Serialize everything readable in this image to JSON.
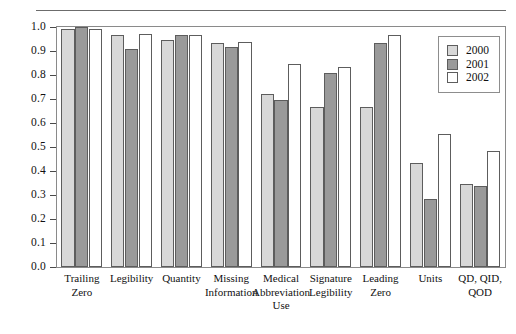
{
  "chart_data": {
    "type": "bar",
    "title": "",
    "xlabel": "",
    "ylabel": "",
    "ylim": [
      0.0,
      1.0
    ],
    "grid": false,
    "legend_position": "top-right",
    "ytick_labels": [
      "1.0",
      "0.9",
      "0.8",
      "0.7",
      "0.6",
      "0.5",
      "0.4",
      "0.3",
      "0.2",
      "0.1",
      "0.0"
    ],
    "ytick_values": [
      1.0,
      0.9,
      0.8,
      0.7,
      0.6,
      0.5,
      0.4,
      0.3,
      0.2,
      0.1,
      0.0
    ],
    "categories": [
      "Trailing Zero",
      "Legibility",
      "Quantity",
      "Missing Information",
      "Medical Abbreviation Use",
      "Signature Legibility",
      "Leading Zero",
      "Units",
      "QD, QID, QOD"
    ],
    "category_lines": [
      [
        "Trailing",
        "Zero"
      ],
      [
        "Legibility"
      ],
      [
        "Quantity"
      ],
      [
        "Missing",
        "Information"
      ],
      [
        "Medical",
        "Abbreviation",
        "Use"
      ],
      [
        "Signature",
        "Legibility"
      ],
      [
        "Leading",
        "Zero"
      ],
      [
        "Units"
      ],
      [
        "QD, QID,",
        "QOD"
      ]
    ],
    "series": [
      {
        "name": "2000",
        "color": "#d8d8d8",
        "values": [
          0.99,
          0.965,
          0.945,
          0.935,
          0.72,
          0.665,
          0.665,
          0.435,
          0.345
        ]
      },
      {
        "name": "2001",
        "color": "#9a9a9a",
        "values": [
          1.0,
          0.908,
          0.968,
          0.918,
          0.695,
          0.808,
          0.935,
          0.285,
          0.338
        ]
      },
      {
        "name": "2002",
        "color": "#ffffff",
        "values": [
          0.99,
          0.972,
          0.965,
          0.938,
          0.845,
          0.833,
          0.965,
          0.555,
          0.483
        ]
      }
    ]
  },
  "legend": {
    "entries": [
      {
        "label": "2000",
        "color": "#d8d8d8"
      },
      {
        "label": "2001",
        "color": "#9a9a9a"
      },
      {
        "label": "2002",
        "color": "#ffffff"
      }
    ]
  }
}
